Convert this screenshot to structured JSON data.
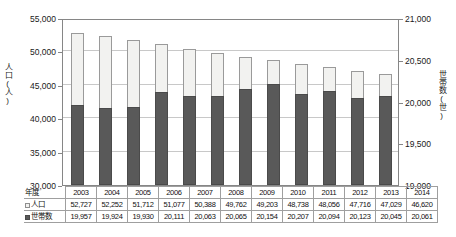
{
  "chart_data": {
    "type": "bar",
    "title": "",
    "subtitle": "",
    "xlabel": "",
    "ylabel": "人口(人)",
    "y2label": "世帯数(世)",
    "grid": true,
    "legend_position": "table-row-headers",
    "categories": [
      "2003",
      "2004",
      "2005",
      "2006",
      "2007",
      "2008",
      "2009",
      "2010",
      "2011",
      "2012",
      "2013",
      "2014"
    ],
    "ylim": [
      30000,
      55000
    ],
    "ytick_step": 5000,
    "yticks": [
      "30,000",
      "35,000",
      "40,000",
      "45,000",
      "50,000",
      "55,000"
    ],
    "y2lim": [
      19000,
      21000
    ],
    "y2tick_step": 500,
    "y2ticks": [
      "19,000",
      "19,500",
      "20,000",
      "20,500",
      "21,000"
    ],
    "series": [
      {
        "name": "人口",
        "axis": "left",
        "color": "#f2f2f0",
        "border_color": "#9a9a9a",
        "values": [
          52727,
          52252,
          51712,
          51077,
          50388,
          49762,
          49203,
          48738,
          48056,
          47716,
          47029,
          46620
        ],
        "labels": [
          "52,727",
          "52,252",
          "51,712",
          "51,077",
          "50,388",
          "49,762",
          "49,203",
          "48,738",
          "48,056",
          "47,716",
          "47,029",
          "46,620"
        ]
      },
      {
        "name": "世帯数",
        "axis": "right",
        "color": "#595959",
        "border_color": "#4a4a4a",
        "values": [
          19957,
          19924,
          19930,
          20111,
          20063,
          20065,
          20154,
          20207,
          20094,
          20123,
          20045,
          20061
        ],
        "labels": [
          "19,957",
          "19,924",
          "19,930",
          "20,111",
          "20,063",
          "20,065",
          "20,154",
          "20,207",
          "20,094",
          "20,123",
          "20,045",
          "20,061"
        ]
      }
    ]
  },
  "table": {
    "year_header": "年度",
    "rows": [
      {
        "label": "人口",
        "marker": "pop"
      },
      {
        "label": "世帯数",
        "marker": "hh"
      }
    ]
  }
}
